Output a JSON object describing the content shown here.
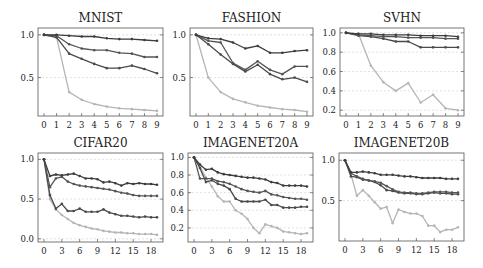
{
  "figure": {
    "width": 483,
    "height": 268
  },
  "series_colors": [
    "#3d3d3d",
    "#555555",
    "#4a4a4a",
    "#b5b5b5"
  ],
  "chart_data": [
    {
      "type": "line",
      "title": "MNIST",
      "xlabel": "",
      "ylabel": "",
      "x": [
        0,
        1,
        2,
        3,
        4,
        5,
        6,
        7,
        8,
        9
      ],
      "xticks": [
        0,
        1,
        2,
        3,
        4,
        5,
        6,
        7,
        8,
        9
      ],
      "yticks": [
        0.5,
        1.0
      ],
      "ytick_labels": [
        "0.5",
        "1.0"
      ],
      "ylim": [
        0.05,
        1.08
      ],
      "grid": true,
      "legend": false,
      "box": {
        "x": 38,
        "y": 28,
        "w": 125,
        "h": 88
      },
      "series": [
        {
          "name": "series-1",
          "values": [
            1.0,
            1.0,
            0.99,
            0.98,
            0.98,
            0.96,
            0.95,
            0.95,
            0.94,
            0.93
          ]
        },
        {
          "name": "series-2",
          "values": [
            1.0,
            0.99,
            0.89,
            0.84,
            0.82,
            0.82,
            0.79,
            0.78,
            0.74,
            0.74
          ]
        },
        {
          "name": "series-3",
          "values": [
            1.0,
            0.97,
            0.78,
            0.72,
            0.66,
            0.61,
            0.61,
            0.64,
            0.6,
            0.55
          ]
        },
        {
          "name": "series-4",
          "values": [
            1.0,
            0.97,
            0.33,
            0.24,
            0.19,
            0.16,
            0.14,
            0.13,
            0.12,
            0.11
          ]
        }
      ]
    },
    {
      "type": "line",
      "title": "FASHION",
      "xlabel": "",
      "ylabel": "",
      "x": [
        0,
        1,
        2,
        3,
        4,
        5,
        6,
        7,
        8,
        9
      ],
      "xticks": [
        0,
        1,
        2,
        3,
        4,
        5,
        6,
        7,
        8,
        9
      ],
      "yticks": [
        0.5,
        1.0
      ],
      "ytick_labels": [
        "0.5",
        "1.0"
      ],
      "ylim": [
        0.05,
        1.08
      ],
      "grid": true,
      "legend": false,
      "box": {
        "x": 190,
        "y": 28,
        "w": 123,
        "h": 88
      },
      "series": [
        {
          "name": "series-1",
          "values": [
            1.0,
            0.96,
            0.95,
            0.91,
            0.84,
            0.87,
            0.79,
            0.79,
            0.81,
            0.82
          ]
        },
        {
          "name": "series-2",
          "values": [
            1.0,
            0.93,
            0.91,
            0.67,
            0.59,
            0.69,
            0.59,
            0.54,
            0.63,
            0.63
          ]
        },
        {
          "name": "series-3",
          "values": [
            1.0,
            0.89,
            0.77,
            0.66,
            0.57,
            0.65,
            0.54,
            0.48,
            0.5,
            0.45
          ]
        },
        {
          "name": "series-4",
          "values": [
            1.0,
            0.5,
            0.33,
            0.25,
            0.21,
            0.17,
            0.15,
            0.13,
            0.12,
            0.1
          ]
        }
      ]
    },
    {
      "type": "line",
      "title": "SVHN",
      "xlabel": "",
      "ylabel": "",
      "x": [
        0,
        1,
        2,
        3,
        4,
        5,
        6,
        7,
        8,
        9
      ],
      "xticks": [
        0,
        1,
        2,
        3,
        4,
        5,
        6,
        7,
        8,
        9
      ],
      "yticks": [
        0.2,
        0.4,
        0.6,
        0.8,
        1.0
      ],
      "ytick_labels": [
        "0.2",
        "0.4",
        "0.6",
        "0.8",
        "1.0"
      ],
      "ylim": [
        0.14,
        1.05
      ],
      "grid": true,
      "legend": false,
      "box": {
        "x": 340,
        "y": 28,
        "w": 124,
        "h": 88
      },
      "series": [
        {
          "name": "series-1",
          "values": [
            1.0,
            0.99,
            0.99,
            0.98,
            0.98,
            0.98,
            0.97,
            0.97,
            0.97,
            0.96
          ]
        },
        {
          "name": "series-2",
          "values": [
            1.0,
            0.98,
            0.97,
            0.96,
            0.96,
            0.95,
            0.95,
            0.95,
            0.94,
            0.94
          ]
        },
        {
          "name": "series-3",
          "values": [
            1.0,
            0.97,
            0.96,
            0.94,
            0.91,
            0.91,
            0.85,
            0.85,
            0.85,
            0.85
          ]
        },
        {
          "name": "series-4",
          "values": [
            1.0,
            0.99,
            0.66,
            0.49,
            0.4,
            0.48,
            0.28,
            0.36,
            0.22,
            0.2
          ]
        }
      ]
    },
    {
      "type": "line",
      "title": "CIFAR20",
      "xlabel": "",
      "ylabel": "",
      "x": [
        0,
        1,
        2,
        3,
        4,
        5,
        6,
        7,
        8,
        9,
        10,
        11,
        12,
        13,
        14,
        15,
        16,
        17,
        18,
        19
      ],
      "xticks": [
        0,
        3,
        6,
        9,
        12,
        15,
        18
      ],
      "yticks": [
        0.0,
        0.5,
        1.0
      ],
      "ytick_labels": [
        "0.0",
        "0.5",
        "1.0"
      ],
      "ylim": [
        -0.04,
        1.08
      ],
      "grid": true,
      "legend": false,
      "box": {
        "x": 38,
        "y": 153,
        "w": 125,
        "h": 89
      },
      "series": [
        {
          "name": "series-1",
          "values": [
            1.0,
            0.79,
            0.81,
            0.8,
            0.81,
            0.82,
            0.79,
            0.76,
            0.76,
            0.75,
            0.71,
            0.72,
            0.7,
            0.67,
            0.7,
            0.69,
            0.7,
            0.69,
            0.69,
            0.68
          ]
        },
        {
          "name": "series-2",
          "values": [
            1.0,
            0.65,
            0.76,
            0.78,
            0.72,
            0.69,
            0.67,
            0.66,
            0.65,
            0.64,
            0.63,
            0.62,
            0.6,
            0.58,
            0.57,
            0.55,
            0.54,
            0.54,
            0.54,
            0.54
          ]
        },
        {
          "name": "series-3",
          "values": [
            1.0,
            0.55,
            0.38,
            0.44,
            0.35,
            0.35,
            0.38,
            0.34,
            0.34,
            0.34,
            0.37,
            0.33,
            0.31,
            0.29,
            0.29,
            0.28,
            0.27,
            0.28,
            0.27,
            0.27
          ]
        },
        {
          "name": "series-4",
          "values": [
            1.0,
            0.5,
            0.37,
            0.3,
            0.25,
            0.2,
            0.17,
            0.15,
            0.13,
            0.12,
            0.1,
            0.09,
            0.08,
            0.08,
            0.07,
            0.07,
            0.06,
            0.06,
            0.06,
            0.05
          ]
        }
      ]
    },
    {
      "type": "line",
      "title": "IMAGENET20A",
      "xlabel": "",
      "ylabel": "",
      "x": [
        0,
        1,
        2,
        3,
        4,
        5,
        6,
        7,
        8,
        9,
        10,
        11,
        12,
        13,
        14,
        15,
        16,
        17,
        18,
        19
      ],
      "xticks": [
        0,
        3,
        6,
        9,
        12,
        15,
        18
      ],
      "yticks": [
        0.2,
        0.4,
        0.6,
        0.8,
        1.0
      ],
      "ytick_labels": [
        "0.2",
        "0.4",
        "0.6",
        "0.8",
        "1.0"
      ],
      "ylim": [
        0.04,
        1.05
      ],
      "grid": true,
      "legend": false,
      "box": {
        "x": 188,
        "y": 153,
        "w": 125,
        "h": 89
      },
      "series": [
        {
          "name": "series-1",
          "values": [
            1.0,
            0.92,
            0.86,
            0.87,
            0.83,
            0.81,
            0.8,
            0.79,
            0.78,
            0.77,
            0.77,
            0.76,
            0.75,
            0.72,
            0.71,
            0.68,
            0.68,
            0.68,
            0.68,
            0.67
          ]
        },
        {
          "name": "series-2",
          "values": [
            1.0,
            0.76,
            0.76,
            0.76,
            0.73,
            0.72,
            0.7,
            0.67,
            0.64,
            0.62,
            0.61,
            0.6,
            0.62,
            0.58,
            0.57,
            0.55,
            0.54,
            0.53,
            0.53,
            0.52
          ]
        },
        {
          "name": "series-3",
          "values": [
            1.0,
            0.88,
            0.72,
            0.74,
            0.7,
            0.68,
            0.64,
            0.53,
            0.5,
            0.5,
            0.5,
            0.5,
            0.52,
            0.46,
            0.46,
            0.43,
            0.43,
            0.43,
            0.44,
            0.44
          ]
        },
        {
          "name": "series-4",
          "values": [
            1.0,
            0.9,
            0.77,
            0.67,
            0.56,
            0.5,
            0.5,
            0.4,
            0.36,
            0.3,
            0.2,
            0.14,
            0.24,
            0.22,
            0.2,
            0.16,
            0.15,
            0.14,
            0.13,
            0.14
          ]
        }
      ]
    },
    {
      "type": "line",
      "title": "IMAGENET20B",
      "xlabel": "",
      "ylabel": "",
      "x": [
        0,
        1,
        2,
        3,
        4,
        5,
        6,
        7,
        8,
        9,
        10,
        11,
        12,
        13,
        14,
        15,
        16,
        17,
        18,
        19
      ],
      "xticks": [
        0,
        3,
        6,
        9,
        12,
        15,
        18
      ],
      "yticks": [
        0.5,
        1.0
      ],
      "ytick_labels": [
        "0.5",
        "1.0"
      ],
      "ylim": [
        0.0,
        1.09
      ],
      "grid": true,
      "legend": false,
      "box": {
        "x": 339,
        "y": 153,
        "w": 125,
        "h": 88
      },
      "series": [
        {
          "name": "series-1",
          "values": [
            1.0,
            0.85,
            0.85,
            0.86,
            0.85,
            0.84,
            0.82,
            0.82,
            0.82,
            0.81,
            0.8,
            0.8,
            0.79,
            0.78,
            0.78,
            0.78,
            0.78,
            0.77,
            0.77,
            0.77
          ]
        },
        {
          "name": "series-2",
          "values": [
            1.0,
            0.84,
            0.8,
            0.77,
            0.75,
            0.74,
            0.72,
            0.68,
            0.64,
            0.61,
            0.6,
            0.6,
            0.59,
            0.59,
            0.6,
            0.61,
            0.61,
            0.61,
            0.6,
            0.6
          ]
        },
        {
          "name": "series-3",
          "values": [
            1.0,
            0.8,
            0.79,
            0.76,
            0.75,
            0.73,
            0.69,
            0.63,
            0.62,
            0.6,
            0.59,
            0.59,
            0.58,
            0.58,
            0.59,
            0.6,
            0.59,
            0.59,
            0.58,
            0.58
          ]
        },
        {
          "name": "series-4",
          "values": [
            1.0,
            0.83,
            0.56,
            0.63,
            0.56,
            0.48,
            0.4,
            0.42,
            0.22,
            0.39,
            0.36,
            0.34,
            0.34,
            0.31,
            0.19,
            0.19,
            0.11,
            0.14,
            0.14,
            0.17
          ]
        }
      ]
    }
  ]
}
